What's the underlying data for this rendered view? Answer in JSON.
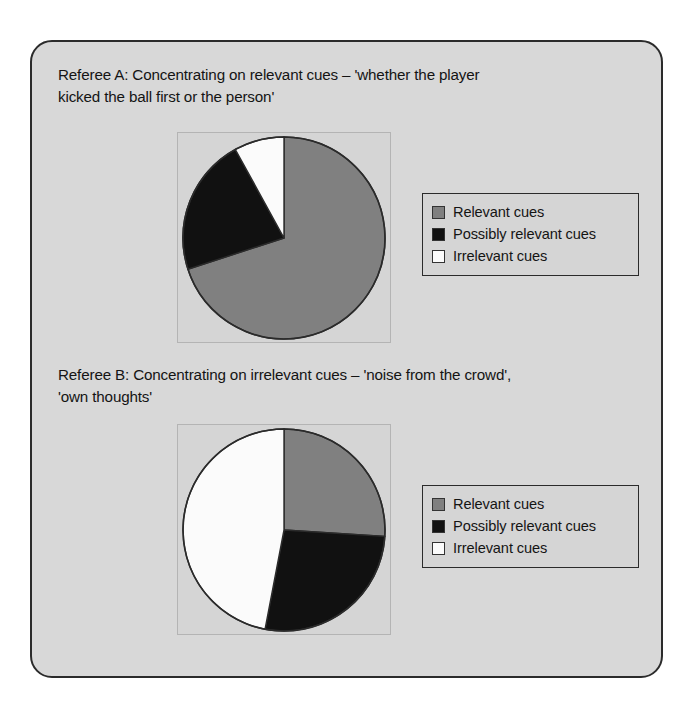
{
  "figure": {
    "panel_bg": "#d8d8d8",
    "panel_border": "#2b2b2b"
  },
  "palette": {
    "relevant": "#808080",
    "possibly_relevant": "#111111",
    "irrelevant": "#fbfbfb",
    "slice_outline": "#2b2b2b",
    "plot_bg": "#d5d5d5"
  },
  "legend_common": {
    "items": [
      {
        "label": "Relevant cues",
        "swatch": "#808080",
        "swatch_name": "relevant-cues-swatch"
      },
      {
        "label": "Possibly relevant cues",
        "swatch": "#111111",
        "swatch_name": "possibly-relevant-cues-swatch"
      },
      {
        "label": "Irrelevant cues",
        "swatch": "#fbfbfb",
        "swatch_name": "irrelevant-cues-swatch"
      }
    ]
  },
  "charts": [
    {
      "id": "referee-a",
      "caption": "Referee A: Concentrating on relevant cues – 'whether the player\nkicked the ball first or the person'"
    },
    {
      "id": "referee-b",
      "caption": "Referee B: Concentrating on irrelevant cues – 'noise from the crowd',\n'own thoughts'"
    }
  ],
  "chart_data": [
    {
      "type": "pie",
      "title": "Referee A: Concentrating on relevant cues – 'whether the player kicked the ball first or the person'",
      "labels": [
        "Relevant cues",
        "Possibly relevant cues",
        "Irrelevant cues"
      ],
      "values": [
        70,
        22,
        8
      ],
      "units": "percent",
      "colors": [
        "#808080",
        "#111111",
        "#fbfbfb"
      ],
      "start_angle_deg": 0,
      "direction": "clockwise",
      "slice_angles_deg": [
        252,
        79,
        29
      ],
      "legend_position": "right",
      "grid": false
    },
    {
      "type": "pie",
      "title": "Referee B: Concentrating on irrelevant cues – 'noise from the crowd', 'own thoughts'",
      "labels": [
        "Relevant cues",
        "Possibly relevant cues",
        "Irrelevant cues"
      ],
      "values": [
        26,
        27,
        47
      ],
      "units": "percent",
      "colors": [
        "#808080",
        "#111111",
        "#fbfbfb"
      ],
      "start_angle_deg": 0,
      "direction": "clockwise",
      "slice_angles_deg": [
        93,
        96,
        171
      ],
      "legend_position": "right",
      "grid": false
    }
  ]
}
